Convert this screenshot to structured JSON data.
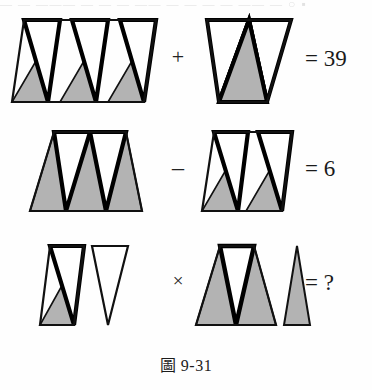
{
  "figure_caption": "圖 9-31",
  "top_cut_text": "— — ——— — — — —— — — — — —— — ○ ▪",
  "colors": {
    "shaded": "#b3b3b3",
    "unshaded": "#ffffff",
    "outline": "#111111",
    "thick_outline": "#000000",
    "page_background": "#fefefe",
    "text": "#1a1a1a"
  },
  "puzzle": {
    "description": "Visual arithmetic puzzle built from rows of alternating shaded (grey) upward triangles and unshaded (white) downward triangles.",
    "rows": [
      {
        "id": "row-1",
        "operator": "+",
        "operator_name": "plus",
        "result": "= 39",
        "result_value": "39",
        "left_figure": {
          "name": "parallelogram-3up-3down",
          "outline_shape": "parallelogram",
          "slant": "right-leaning",
          "up_triangles_shaded": 3,
          "down_triangles_unshaded": 3,
          "total_triangles": 6
        },
        "right_figure": {
          "name": "trapezoid-1up-2down",
          "outline_shape": "trapezoid",
          "slant": "none",
          "up_triangles_shaded": 1,
          "down_triangles_unshaded": 2,
          "total_triangles": 3
        }
      },
      {
        "id": "row-2",
        "operator": "–",
        "operator_name": "minus",
        "result": "= 6",
        "result_value": "6",
        "left_figure": {
          "name": "trapezoid-3up-2down",
          "outline_shape": "trapezoid",
          "slant": "none",
          "up_triangles_shaded": 3,
          "down_triangles_unshaded": 2,
          "total_triangles": 5
        },
        "right_figure": {
          "name": "parallelogram-2up-2down",
          "outline_shape": "parallelogram",
          "slant": "right-leaning",
          "up_triangles_shaded": 2,
          "down_triangles_unshaded": 2,
          "total_triangles": 4
        }
      },
      {
        "id": "row-3",
        "operator": "×",
        "operator_name": "multiply",
        "result": "= ?",
        "result_value": "?",
        "left_figure": {
          "name": "parallelogram-1up-1down-plus-lone-down",
          "outline_shape": "parallelogram-plus-lone-triangle",
          "slant": "right-leaning",
          "up_triangles_shaded": 1,
          "down_triangles_unshaded": 2,
          "total_triangles": 3,
          "lone_triangle": "unshaded-down"
        },
        "right_figure": {
          "name": "trapezoid-2up-1down-plus-lone-up",
          "outline_shape": "trapezoid-plus-lone-triangle",
          "slant": "none",
          "up_triangles_shaded": 3,
          "down_triangles_unshaded": 1,
          "total_triangles": 4,
          "lone_triangle": "shaded-up"
        }
      }
    ]
  }
}
